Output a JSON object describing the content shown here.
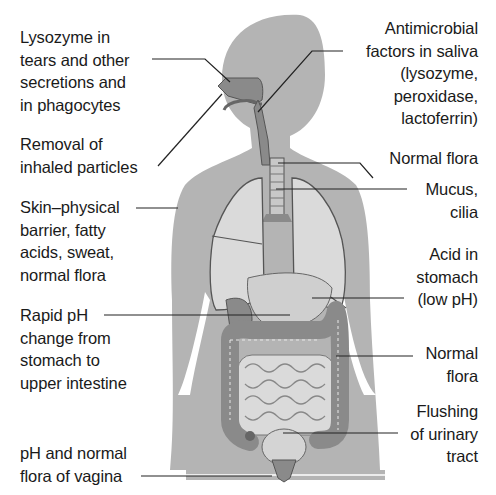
{
  "diagram": {
    "colors": {
      "body": "#b4b4b4",
      "organ_light": "#dadada",
      "organ_dark": "#8a8a8a",
      "outline": "#555555",
      "leader": "#222222",
      "text": "#1a1a1a"
    },
    "labels_left": [
      {
        "id": "lysozyme",
        "text": "Lysozyme in\ntears and other\nsecretions and\nin phagocytes"
      },
      {
        "id": "inhaled",
        "text": "Removal of\ninhaled particles"
      },
      {
        "id": "skin",
        "text": "Skin–physical\nbarrier, fatty\nacids, sweat,\nnormal flora"
      },
      {
        "id": "rapid-ph",
        "text": "Rapid pH\nchange from\nstomach to\nupper intestine"
      },
      {
        "id": "vagina",
        "text": "pH and normal\nflora of vagina"
      }
    ],
    "labels_right": [
      {
        "id": "saliva",
        "text": "Antimicrobial\nfactors in saliva\n(lysozyme,\nperoxidase,\nlactoferrin)"
      },
      {
        "id": "normal-flora-throat",
        "text": "Normal flora"
      },
      {
        "id": "mucus",
        "text": "Mucus,\ncilia"
      },
      {
        "id": "stomach-acid",
        "text": "Acid in\nstomach\n(low pH)"
      },
      {
        "id": "normal-flora-colon",
        "text": "Normal\nflora"
      },
      {
        "id": "urinary",
        "text": "Flushing\nof urinary\ntract"
      }
    ]
  }
}
